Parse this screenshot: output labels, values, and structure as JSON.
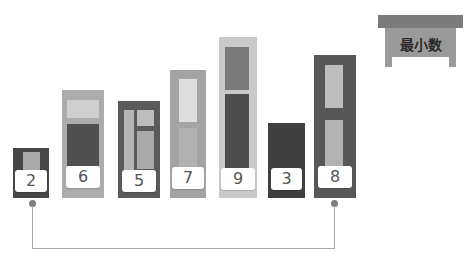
{
  "title_box": {
    "label": "最小数",
    "icon": "table-icon"
  },
  "columns": [
    {
      "value": "2",
      "color": "#4a4a4a"
    },
    {
      "value": "6",
      "color": "#aaaaaa"
    },
    {
      "value": "5",
      "color": "#5e5e5e"
    },
    {
      "value": "7",
      "color": "#a0a0a0"
    },
    {
      "value": "9",
      "color": "#c7c7c7"
    },
    {
      "value": "3",
      "color": "#3f3f3f"
    },
    {
      "value": "8",
      "color": "#585858"
    }
  ],
  "connector": {
    "from_index": 0,
    "to_index": 6,
    "color": "#a6a6a6"
  }
}
